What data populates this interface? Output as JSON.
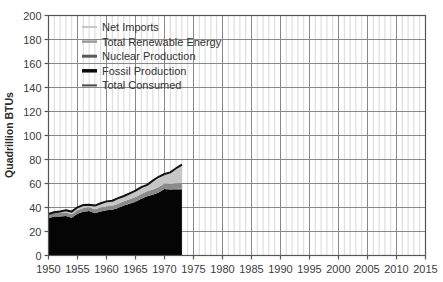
{
  "chart_data": {
    "type": "area",
    "title": "",
    "subtitle": "",
    "xlabel": "",
    "ylabel": "Quadrillion BTUs",
    "xlim": [
      1950,
      2015
    ],
    "ylim": [
      0,
      200
    ],
    "ytick_step": 20,
    "xtick_step": 5,
    "grid": true,
    "minor_grid": "yearly vertical gridlines",
    "legend_position": "top-left inside plot",
    "stacked": true,
    "data_end_year": 1973,
    "ytick_labels": [
      "0",
      "20",
      "40",
      "60",
      "80",
      "100",
      "120",
      "140",
      "160",
      "180",
      "200"
    ],
    "xtick_labels": [
      "1950",
      "1955",
      "1960",
      "1965",
      "1970",
      "1975",
      "1980",
      "1985",
      "1990",
      "1995",
      "2000",
      "2005",
      "2010",
      "2015"
    ],
    "x": [
      1950,
      1951,
      1952,
      1953,
      1954,
      1955,
      1956,
      1957,
      1958,
      1959,
      1960,
      1961,
      1962,
      1963,
      1964,
      1965,
      1966,
      1967,
      1968,
      1969,
      1970,
      1971,
      1972,
      1973
    ],
    "series": [
      {
        "name": "Fossil Production",
        "color": "#050505",
        "values": [
          31.0,
          32.6,
          32.4,
          32.9,
          31.5,
          34.7,
          36.5,
          37.1,
          35.2,
          36.7,
          37.8,
          38.1,
          39.6,
          41.6,
          43.2,
          44.8,
          47.2,
          49.3,
          50.7,
          52.4,
          55.5,
          54.8,
          55.1,
          55.0
        ],
        "stack_order": 1
      },
      {
        "name": "Nuclear Production",
        "color": "#4a4a4a",
        "values": [
          0.0,
          0.0,
          0.0,
          0.0,
          0.0,
          0.0,
          0.0,
          0.0,
          0.0,
          0.0,
          0.01,
          0.02,
          0.03,
          0.04,
          0.04,
          0.04,
          0.06,
          0.09,
          0.14,
          0.15,
          0.24,
          0.41,
          0.58,
          0.91
        ],
        "stack_order": 2
      },
      {
        "name": "Total Renewable Energy",
        "color": "#8a8a8a",
        "values": [
          2.98,
          2.99,
          2.95,
          2.86,
          2.85,
          2.98,
          3.09,
          3.06,
          3.31,
          3.29,
          3.31,
          3.37,
          3.58,
          3.61,
          3.68,
          3.95,
          4.06,
          4.19,
          4.26,
          4.44,
          4.26,
          4.42,
          4.47,
          4.75
        ],
        "stack_order": 3
      },
      {
        "name": "Net Imports",
        "color": "#c6c6c6",
        "values": [
          1.4,
          1.6,
          1.7,
          1.9,
          1.9,
          2.2,
          2.4,
          2.4,
          2.8,
          3.1,
          3.4,
          3.6,
          4.0,
          4.2,
          4.6,
          5.1,
          5.5,
          5.4,
          6.2,
          6.9,
          7.4,
          9.0,
          11.5,
          14.7
        ],
        "stack_order": 4
      }
    ],
    "overlay_line": {
      "name": "Total Consumed",
      "color": "#111111",
      "values": [
        34.6,
        36.1,
        36.7,
        37.7,
        36.6,
        40.2,
        42.1,
        42.2,
        41.6,
        43.5,
        45.1,
        45.7,
        47.8,
        49.6,
        51.8,
        54.0,
        57.0,
        58.9,
        62.4,
        65.6,
        67.9,
        69.3,
        72.7,
        75.7
      ]
    },
    "legend": [
      {
        "label": "Net Imports",
        "color": "#c6c6c6",
        "swatch_weight": 2
      },
      {
        "label": "Total Renewable Energy",
        "color": "#9a9a9a",
        "swatch_weight": 2.5
      },
      {
        "label": "Nuclear Production",
        "color": "#5a5a5a",
        "swatch_weight": 3
      },
      {
        "label": "Fossil Production",
        "color": "#0a0a0a",
        "swatch_weight": 3.5
      },
      {
        "label": "Total Consumed",
        "color": "#4a4a4a",
        "swatch_weight": 2
      }
    ]
  },
  "colors": {
    "background": "#ffffff",
    "axis": "#555555",
    "grid_major": "#888888",
    "grid_minor": "#d8d8d8",
    "text": "#3c3c3c"
  }
}
